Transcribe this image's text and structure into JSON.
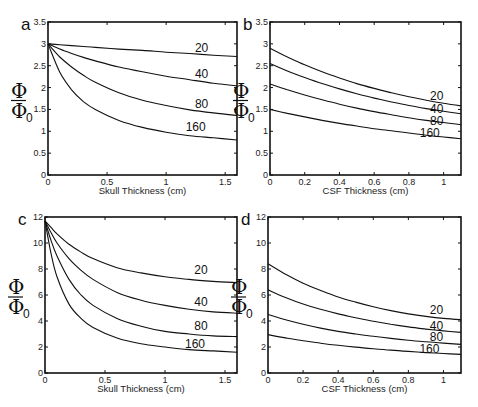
{
  "chart_data": [
    {
      "panel": "a",
      "type": "line",
      "xlabel": "Skull Thickness (cm)",
      "ylabel": "Φ / Φ0",
      "xlim": [
        0,
        1.6
      ],
      "ylim": [
        0,
        3.5
      ],
      "xticks": [
        "0",
        "0.5",
        "1",
        "1.5"
      ],
      "yticks": [
        "0",
        "0.5",
        "1",
        "1.5",
        "2",
        "2.5",
        "3",
        "3.5"
      ],
      "x": [
        0,
        0.1,
        0.2,
        0.3,
        0.4,
        0.6,
        0.8,
        1.0,
        1.2,
        1.4,
        1.6
      ],
      "series": [
        {
          "name": "20",
          "values": [
            3.0,
            2.98,
            2.96,
            2.94,
            2.92,
            2.88,
            2.85,
            2.81,
            2.78,
            2.74,
            2.71
          ]
        },
        {
          "name": "40",
          "values": [
            3.0,
            2.88,
            2.78,
            2.69,
            2.61,
            2.47,
            2.36,
            2.26,
            2.18,
            2.1,
            2.04
          ]
        },
        {
          "name": "80",
          "values": [
            3.0,
            2.7,
            2.47,
            2.28,
            2.12,
            1.88,
            1.71,
            1.59,
            1.49,
            1.42,
            1.36
          ]
        },
        {
          "name": "160",
          "values": [
            3.0,
            2.35,
            1.95,
            1.68,
            1.5,
            1.25,
            1.09,
            0.98,
            0.9,
            0.85,
            0.8
          ]
        }
      ],
      "labels": [
        {
          "text": "20",
          "x": 1.3,
          "y": 2.9
        },
        {
          "text": "40",
          "x": 1.3,
          "y": 2.32
        },
        {
          "text": "80",
          "x": 1.3,
          "y": 1.62
        },
        {
          "text": "160",
          "x": 1.25,
          "y": 1.1
        }
      ]
    },
    {
      "panel": "b",
      "type": "line",
      "xlabel": "CSF Thickness (cm)",
      "ylabel": "Φ / Φ0",
      "xlim": [
        0,
        1.1
      ],
      "ylim": [
        0,
        3.5
      ],
      "xticks": [
        "0",
        "0.2",
        "0.4",
        "0.6",
        "0.8",
        "1"
      ],
      "yticks": [
        "0",
        "0.5",
        "1",
        "1.5",
        "2",
        "2.5",
        "3",
        "3.5"
      ],
      "x": [
        0,
        0.1,
        0.2,
        0.3,
        0.4,
        0.5,
        0.6,
        0.7,
        0.8,
        0.9,
        1.0,
        1.1
      ],
      "series": [
        {
          "name": "20",
          "values": [
            2.9,
            2.7,
            2.52,
            2.36,
            2.22,
            2.09,
            1.98,
            1.88,
            1.79,
            1.71,
            1.64,
            1.58
          ]
        },
        {
          "name": "40",
          "values": [
            2.55,
            2.38,
            2.23,
            2.09,
            1.97,
            1.86,
            1.76,
            1.67,
            1.59,
            1.52,
            1.46,
            1.4
          ]
        },
        {
          "name": "80",
          "values": [
            2.08,
            1.95,
            1.83,
            1.72,
            1.62,
            1.53,
            1.45,
            1.38,
            1.31,
            1.25,
            1.2,
            1.15
          ]
        },
        {
          "name": "160",
          "values": [
            1.5,
            1.41,
            1.33,
            1.25,
            1.18,
            1.12,
            1.06,
            1.01,
            0.96,
            0.91,
            0.87,
            0.83
          ]
        }
      ],
      "labels": [
        {
          "text": "20",
          "x": 0.96,
          "y": 1.8
        },
        {
          "text": "40",
          "x": 0.96,
          "y": 1.5
        },
        {
          "text": "80",
          "x": 0.96,
          "y": 1.24
        },
        {
          "text": "160",
          "x": 0.92,
          "y": 0.95
        }
      ]
    },
    {
      "panel": "c",
      "type": "line",
      "xlabel": "Skull Thickness (cm)",
      "ylabel": "Φ / Φ0",
      "xlim": [
        0,
        1.6
      ],
      "ylim": [
        0,
        12
      ],
      "xticks": [
        "0",
        "0.5",
        "1",
        "1.5"
      ],
      "yticks": [
        "0",
        "2",
        "4",
        "6",
        "8",
        "10",
        "12"
      ],
      "x": [
        0,
        0.05,
        0.1,
        0.2,
        0.3,
        0.4,
        0.6,
        0.8,
        1.0,
        1.2,
        1.4,
        1.6
      ],
      "series": [
        {
          "name": "20",
          "values": [
            11.7,
            11.2,
            10.7,
            9.9,
            9.3,
            8.8,
            8.1,
            7.7,
            7.4,
            7.2,
            7.05,
            6.95
          ]
        },
        {
          "name": "40",
          "values": [
            11.7,
            10.8,
            10.0,
            8.8,
            7.9,
            7.2,
            6.2,
            5.6,
            5.2,
            4.9,
            4.7,
            4.6
          ]
        },
        {
          "name": "80",
          "values": [
            11.7,
            10.2,
            9.0,
            7.2,
            6.0,
            5.2,
            4.2,
            3.6,
            3.2,
            3.0,
            2.85,
            2.8
          ]
        },
        {
          "name": "160",
          "values": [
            11.7,
            9.2,
            7.4,
            5.3,
            4.2,
            3.5,
            2.7,
            2.25,
            2.0,
            1.8,
            1.7,
            1.6
          ]
        }
      ],
      "labels": [
        {
          "text": "20",
          "x": 1.3,
          "y": 7.9
        },
        {
          "text": "40",
          "x": 1.3,
          "y": 5.5
        },
        {
          "text": "80",
          "x": 1.3,
          "y": 3.6
        },
        {
          "text": "160",
          "x": 1.25,
          "y": 2.2
        }
      ]
    },
    {
      "panel": "d",
      "type": "line",
      "xlabel": "CSF Thickness (cm)",
      "ylabel": "Φ / Φ0",
      "xlim": [
        0,
        1.1
      ],
      "ylim": [
        0,
        12
      ],
      "xticks": [
        "0",
        "0.2",
        "0.4",
        "0.6",
        "0.8",
        "1"
      ],
      "yticks": [
        "0",
        "2",
        "4",
        "6",
        "8",
        "10",
        "12"
      ],
      "x": [
        0,
        0.1,
        0.2,
        0.3,
        0.4,
        0.5,
        0.6,
        0.7,
        0.8,
        0.9,
        1.0,
        1.1
      ],
      "series": [
        {
          "name": "20",
          "values": [
            8.4,
            7.6,
            6.9,
            6.35,
            5.85,
            5.45,
            5.1,
            4.8,
            4.55,
            4.35,
            4.2,
            4.1
          ]
        },
        {
          "name": "40",
          "values": [
            6.4,
            5.8,
            5.3,
            4.9,
            4.55,
            4.25,
            3.98,
            3.75,
            3.55,
            3.38,
            3.24,
            3.12
          ]
        },
        {
          "name": "80",
          "values": [
            4.5,
            4.1,
            3.75,
            3.45,
            3.2,
            3.0,
            2.82,
            2.66,
            2.52,
            2.4,
            2.3,
            2.2
          ]
        },
        {
          "name": "160",
          "values": [
            2.95,
            2.7,
            2.48,
            2.29,
            2.13,
            1.99,
            1.87,
            1.76,
            1.66,
            1.57,
            1.5,
            1.43
          ]
        }
      ],
      "labels": [
        {
          "text": "20",
          "x": 0.96,
          "y": 4.85
        },
        {
          "text": "40",
          "x": 0.96,
          "y": 3.6
        },
        {
          "text": "80",
          "x": 0.96,
          "y": 2.75
        },
        {
          "text": "160",
          "x": 0.92,
          "y": 1.85
        }
      ]
    }
  ],
  "panels": [
    {
      "letter": "a",
      "box": [
        48,
        22,
        237,
        175
      ]
    },
    {
      "letter": "b",
      "box": [
        270,
        22,
        461,
        175
      ]
    },
    {
      "letter": "c",
      "box": [
        45,
        217,
        237,
        373
      ]
    },
    {
      "letter": "d",
      "box": [
        268,
        217,
        461,
        373
      ]
    }
  ],
  "ylabel_num": "Φ",
  "ylabel_den": "Φ",
  "ylabel_sub": "0"
}
